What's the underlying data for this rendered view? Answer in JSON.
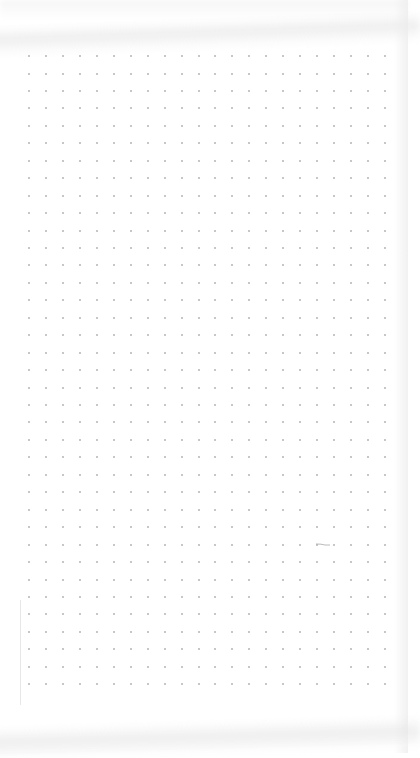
{
  "page": {
    "type": "dot-grid notebook page",
    "background_color": "#ffffff",
    "dot_color": "#b4b4b4"
  },
  "grid": {
    "columns": 22,
    "rows": 37,
    "origin_x": 29,
    "origin_y": 56,
    "spacing_x": 16.95,
    "spacing_y": 17.45
  },
  "marks": [
    {
      "name": "pencil-mark",
      "x": 316,
      "y": 543,
      "width": 14
    }
  ]
}
